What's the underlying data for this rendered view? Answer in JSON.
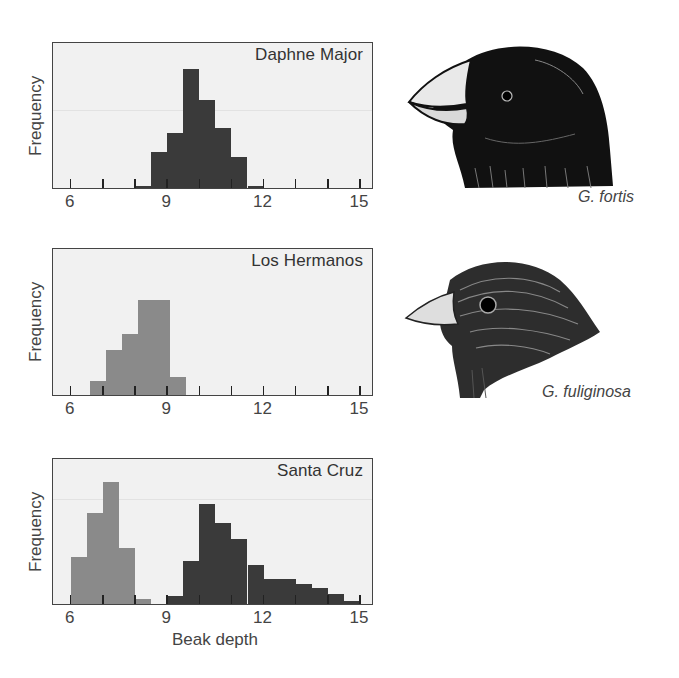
{
  "chart_data": [
    {
      "type": "bar",
      "title": "Daphne Major",
      "xlabel": "",
      "ylabel": "Frequency",
      "xlim": [
        5.5,
        15.5
      ],
      "xticks": [
        6,
        7,
        8,
        9,
        10,
        11,
        12,
        13,
        14,
        15
      ],
      "xtick_labels": [
        "6",
        "9",
        "12",
        "15"
      ],
      "y_units": "relative (px of plot height, max ~120)",
      "series": [
        {
          "name": "G. fortis",
          "color": "#3a3a3a",
          "bins": [
            {
              "from": 8.0,
              "to": 8.5,
              "value": 2
            },
            {
              "from": 8.5,
              "to": 9.0,
              "value": 36
            },
            {
              "from": 9.0,
              "to": 9.5,
              "value": 55
            },
            {
              "from": 9.5,
              "to": 10.0,
              "value": 119
            },
            {
              "from": 10.0,
              "to": 10.5,
              "value": 88
            },
            {
              "from": 10.5,
              "to": 11.0,
              "value": 60
            },
            {
              "from": 11.0,
              "to": 11.5,
              "value": 31
            },
            {
              "from": 11.5,
              "to": 12.0,
              "value": 2
            }
          ]
        }
      ]
    },
    {
      "type": "bar",
      "title": "Los Hermanos",
      "xlabel": "",
      "ylabel": "Frequency",
      "xlim": [
        5.5,
        15.5
      ],
      "xticks": [
        6,
        7,
        8,
        9,
        10,
        11,
        12,
        13,
        14,
        15
      ],
      "xtick_labels": [
        "6",
        "9",
        "12",
        "15"
      ],
      "y_units": "relative (px of plot height)",
      "series": [
        {
          "name": "G. fuliginosa",
          "color": "#8a8a8a",
          "bins": [
            {
              "from": 6.6,
              "to": 7.1,
              "value": 14
            },
            {
              "from": 7.1,
              "to": 7.6,
              "value": 45
            },
            {
              "from": 7.6,
              "to": 8.1,
              "value": 61
            },
            {
              "from": 8.1,
              "to": 8.6,
              "value": 95
            },
            {
              "from": 8.6,
              "to": 9.1,
              "value": 95
            },
            {
              "from": 9.1,
              "to": 9.6,
              "value": 18
            }
          ]
        }
      ]
    },
    {
      "type": "bar",
      "title": "Santa Cruz",
      "xlabel": "Beak depth",
      "ylabel": "Frequency",
      "xlim": [
        5.5,
        15.5
      ],
      "xticks": [
        6,
        7,
        8,
        9,
        10,
        11,
        12,
        13,
        14,
        15
      ],
      "xtick_labels": [
        "6",
        "9",
        "12",
        "15"
      ],
      "y_units": "relative (px of plot height)",
      "series": [
        {
          "name": "G. fuliginosa",
          "color": "#8a8a8a",
          "bins": [
            {
              "from": 6.0,
              "to": 6.5,
              "value": 47
            },
            {
              "from": 6.5,
              "to": 7.0,
              "value": 91
            },
            {
              "from": 7.0,
              "to": 7.5,
              "value": 122
            },
            {
              "from": 7.5,
              "to": 8.0,
              "value": 56
            },
            {
              "from": 8.0,
              "to": 8.5,
              "value": 5
            }
          ]
        },
        {
          "name": "G. fortis",
          "color": "#3a3a3a",
          "bins": [
            {
              "from": 9.0,
              "to": 9.5,
              "value": 8
            },
            {
              "from": 9.5,
              "to": 10.0,
              "value": 43
            },
            {
              "from": 10.0,
              "to": 10.5,
              "value": 100
            },
            {
              "from": 10.5,
              "to": 11.0,
              "value": 81
            },
            {
              "from": 11.0,
              "to": 11.5,
              "value": 65
            },
            {
              "from": 11.5,
              "to": 12.0,
              "value": 39
            },
            {
              "from": 12.0,
              "to": 12.5,
              "value": 25
            },
            {
              "from": 12.5,
              "to": 13.0,
              "value": 25
            },
            {
              "from": 13.0,
              "to": 13.5,
              "value": 20
            },
            {
              "from": 13.5,
              "to": 14.0,
              "value": 16
            },
            {
              "from": 14.0,
              "to": 14.5,
              "value": 10
            },
            {
              "from": 14.5,
              "to": 15.0,
              "value": 3
            }
          ]
        }
      ]
    }
  ],
  "panels": {
    "daphne": {
      "title": "Daphne Major",
      "ylabel": "Frequency"
    },
    "hermanos": {
      "title": "Los Hermanos",
      "ylabel": "Frequency"
    },
    "santacruz": {
      "title": "Santa Cruz",
      "ylabel": "Frequency",
      "xlabel": "Beak depth"
    }
  },
  "tick_labels": [
    "6",
    "9",
    "12",
    "15"
  ],
  "birds": {
    "fortis": {
      "label": "G. fortis"
    },
    "fuliginosa": {
      "label": "G. fuliginosa"
    }
  },
  "colors": {
    "plot_bg": "#f1f1f1",
    "fortis_bar": "#3a3a3a",
    "fuliginosa_bar": "#8a8a8a",
    "frame": "#444444"
  }
}
